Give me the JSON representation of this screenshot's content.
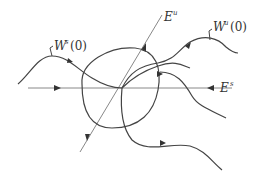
{
  "diagram": {
    "labels": {
      "stable_manifold": {
        "base": "W",
        "sup": "s",
        "arg": "(0)"
      },
      "unstable_manifold": {
        "base": "W",
        "sup": "u",
        "arg": "(0)"
      },
      "unstable_eigenspace": {
        "base": "E",
        "sup": "u"
      },
      "stable_eigenspace": {
        "base": "E",
        "sup": "s"
      }
    },
    "colors": {
      "stroke": "#444444",
      "axis": "#888888",
      "background": "#ffffff"
    }
  }
}
